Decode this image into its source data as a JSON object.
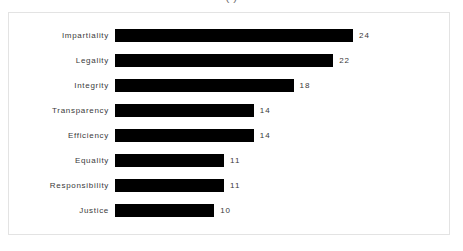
{
  "chart_data": {
    "type": "bar",
    "orientation": "horizontal",
    "title": "(                                             )",
    "title_clipped": true,
    "categories": [
      "Impartiality",
      "Legality",
      "Integrity",
      "Transparency",
      "Efficiency",
      "Equality",
      "Responsibility",
      "Justice"
    ],
    "values": [
      24,
      22,
      18,
      14,
      14,
      11,
      11,
      10
    ],
    "value_labels": [
      "24",
      "22",
      "18",
      "14",
      "14",
      "11",
      "11",
      "10"
    ],
    "xlabel": "",
    "ylabel": "",
    "xlim": [
      0,
      24
    ],
    "grid": false,
    "legend": false,
    "bar_color": "#000000",
    "label_color": "#3a3a3a",
    "frame_color": "#e3e3e3",
    "background": "#ffffff"
  }
}
